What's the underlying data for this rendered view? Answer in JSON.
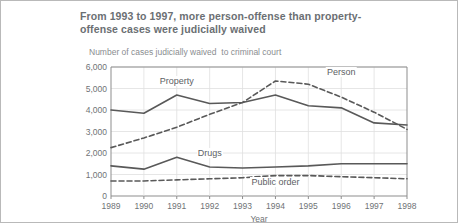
{
  "header": {
    "title": "From 1993 to 1997, more person-offense than property-offense cases were judicially waived",
    "subtitle": "Number of cases judicially waived  to criminal court"
  },
  "chart_data": {
    "type": "line",
    "title": "From 1993 to 1997, more person-offense than property-offense cases were judicially waived",
    "subtitle": "Number of cases judicially waived  to criminal court",
    "xlabel": "Year",
    "ylabel": "",
    "categories": [
      "1989",
      "1990",
      "1991",
      "1992",
      "1993",
      "1994",
      "1995",
      "1996",
      "1997",
      "1998"
    ],
    "ytick_labels": [
      "6,000",
      "5,000",
      "4,000",
      "3,000",
      "2,000",
      "1,000",
      "0"
    ],
    "ytick_values": [
      6000,
      5000,
      4000,
      3000,
      2000,
      1000,
      0
    ],
    "ylim": [
      0,
      6000
    ],
    "grid": true,
    "legend_position": "inline-annotations",
    "series": [
      {
        "name": "Property",
        "style": "solid",
        "color": "#595959",
        "label_x": 1991,
        "label_y": 5300,
        "values": [
          4000,
          3850,
          4700,
          4300,
          4350,
          4700,
          4200,
          4100,
          3400,
          3300
        ]
      },
      {
        "name": "Person",
        "style": "dashed",
        "color": "#595959",
        "label_x": 1996,
        "label_y": 5700,
        "values": [
          2250,
          2700,
          3200,
          3800,
          4350,
          5350,
          5200,
          4600,
          3900,
          3100
        ]
      },
      {
        "name": "Drugs",
        "style": "solid",
        "color": "#595959",
        "label_x": 1992,
        "label_y": 1950,
        "values": [
          1400,
          1250,
          1800,
          1350,
          1300,
          1350,
          1400,
          1500,
          1500,
          1500
        ]
      },
      {
        "name": "Public order",
        "style": "dashed",
        "color": "#595959",
        "label_x": 1994,
        "label_y": 620,
        "values": [
          700,
          700,
          750,
          800,
          850,
          950,
          950,
          900,
          850,
          800
        ]
      }
    ]
  }
}
